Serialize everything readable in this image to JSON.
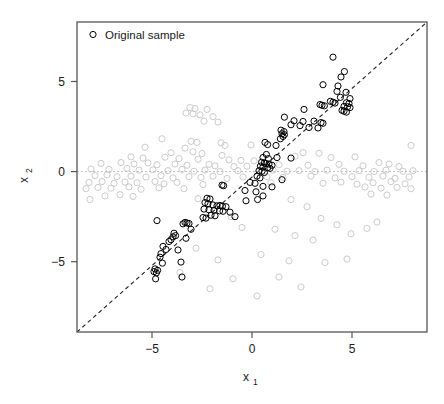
{
  "chart_data": {
    "type": "scatter",
    "title": "",
    "xlabel": "x_1",
    "xlabel_base": "x",
    "xlabel_sub": "1",
    "ylabel": "x_2",
    "ylabel_base": "x",
    "ylabel_sub": "2",
    "xlim": [
      -8.75,
      8.75
    ],
    "ylim": [
      -8.9,
      8.3
    ],
    "xticks": [
      -5,
      0,
      5
    ],
    "xticklabels": [
      "−5",
      "0",
      "5"
    ],
    "yticks": [
      -5,
      0,
      5
    ],
    "yticklabels": [
      "−5",
      "0",
      "5"
    ],
    "grid": false,
    "frame": true,
    "legend": {
      "position": "top-left",
      "entries": [
        {
          "label": "Original sample",
          "marker": "open-circle",
          "color": "#000000"
        }
      ]
    },
    "annotations": [
      {
        "name": "identity-line",
        "type": "line",
        "style": "dashed",
        "color": "#000000",
        "from": [
          -8.75,
          -8.9
        ],
        "to": [
          8.75,
          8.3
        ]
      },
      {
        "name": "zero-line",
        "type": "hline",
        "style": "dashed",
        "color": "#c0c0c0",
        "y": 0
      }
    ],
    "series": [
      {
        "name": "Original sample",
        "marker": "open-circle",
        "color": "#000000",
        "radius": 3.1,
        "linewidth": 1.0,
        "points": [
          [
            4.05,
            6.35
          ],
          [
            4.62,
            5.55
          ],
          [
            4.45,
            5.25
          ],
          [
            3.55,
            4.82
          ],
          [
            4.3,
            4.75
          ],
          [
            4.25,
            4.45
          ],
          [
            4.7,
            4.4
          ],
          [
            4.42,
            4.12
          ],
          [
            4.9,
            4.05
          ],
          [
            3.92,
            3.9
          ],
          [
            4.05,
            3.85
          ],
          [
            4.15,
            3.8
          ],
          [
            4.72,
            3.82
          ],
          [
            4.85,
            3.78
          ],
          [
            3.4,
            3.72
          ],
          [
            3.5,
            3.68
          ],
          [
            3.62,
            3.65
          ],
          [
            4.6,
            3.62
          ],
          [
            4.78,
            3.6
          ],
          [
            4.9,
            3.55
          ],
          [
            2.6,
            3.45
          ],
          [
            4.5,
            3.4
          ],
          [
            4.6,
            3.35
          ],
          [
            4.72,
            3.3
          ],
          [
            1.62,
            3.02
          ],
          [
            2.1,
            2.82
          ],
          [
            2.55,
            2.78
          ],
          [
            3.1,
            2.8
          ],
          [
            3.45,
            2.72
          ],
          [
            3.55,
            2.68
          ],
          [
            1.95,
            2.6
          ],
          [
            2.4,
            2.55
          ],
          [
            2.85,
            2.45
          ],
          [
            3.3,
            2.42
          ],
          [
            1.45,
            2.3
          ],
          [
            1.6,
            2.22
          ],
          [
            1.5,
            2.1
          ],
          [
            1.62,
            2.05
          ],
          [
            1.55,
            1.95
          ],
          [
            1.42,
            1.82
          ],
          [
            0.65,
            1.62
          ],
          [
            0.78,
            1.5
          ],
          [
            1.2,
            1.45
          ],
          [
            0.72,
            0.95
          ],
          [
            0.55,
            0.78
          ],
          [
            0.82,
            0.72
          ],
          [
            1.25,
            0.78
          ],
          [
            1.95,
            0.75
          ],
          [
            0.48,
            0.52
          ],
          [
            0.62,
            0.48
          ],
          [
            0.7,
            0.45
          ],
          [
            0.85,
            0.42
          ],
          [
            1.0,
            0.35
          ],
          [
            0.42,
            0.3
          ],
          [
            0.55,
            0.25
          ],
          [
            0.78,
            0.22
          ],
          [
            0.9,
            0.18
          ],
          [
            0.35,
            0.05
          ],
          [
            0.5,
            0.02
          ],
          [
            0.62,
            -0.05
          ],
          [
            0.25,
            -0.25
          ],
          [
            0.4,
            -0.35
          ],
          [
            1.5,
            -0.45
          ],
          [
            -0.1,
            -0.6
          ],
          [
            0.15,
            -0.65
          ],
          [
            -1.5,
            -0.75
          ],
          [
            -1.42,
            -0.78
          ],
          [
            0.55,
            -0.82
          ],
          [
            1.0,
            -0.85
          ],
          [
            -0.35,
            -1.05
          ],
          [
            0.2,
            -1.12
          ],
          [
            0.55,
            -1.35
          ],
          [
            -2.25,
            -1.48
          ],
          [
            -2.1,
            -1.52
          ],
          [
            0.28,
            -1.55
          ],
          [
            -0.3,
            -1.62
          ],
          [
            -2.35,
            -1.72
          ],
          [
            -2.2,
            -1.78
          ],
          [
            -1.95,
            -1.85
          ],
          [
            -1.75,
            -1.9
          ],
          [
            -1.6,
            -1.88
          ],
          [
            -1.48,
            -1.92
          ],
          [
            -1.3,
            -1.95
          ],
          [
            -2.4,
            -2.08
          ],
          [
            -2.15,
            -2.12
          ],
          [
            -1.9,
            -2.15
          ],
          [
            -1.62,
            -2.18
          ],
          [
            -1.45,
            -2.2
          ],
          [
            -1.1,
            -2.25
          ],
          [
            -2.05,
            -2.42
          ],
          [
            -1.85,
            -2.45
          ],
          [
            -2.45,
            -2.55
          ],
          [
            -2.3,
            -2.58
          ],
          [
            -0.85,
            -2.5
          ],
          [
            -3.35,
            -2.82
          ],
          [
            -3.25,
            -2.85
          ],
          [
            -3.15,
            -2.88
          ],
          [
            -3.45,
            -2.9
          ],
          [
            -4.75,
            -2.72
          ],
          [
            -3.05,
            -3.2
          ],
          [
            -3.9,
            -3.42
          ],
          [
            -3.82,
            -3.55
          ],
          [
            -3.95,
            -3.62
          ],
          [
            -3.3,
            -3.7
          ],
          [
            -4.05,
            -3.78
          ],
          [
            -4.15,
            -3.88
          ],
          [
            -4.45,
            -4.15
          ],
          [
            -4.3,
            -4.32
          ],
          [
            -3.7,
            -4.35
          ],
          [
            -4.55,
            -4.55
          ],
          [
            -4.6,
            -4.75
          ],
          [
            -3.55,
            -5.02
          ],
          [
            -4.48,
            -5.08
          ],
          [
            -4.85,
            -5.4
          ],
          [
            -4.72,
            -5.48
          ],
          [
            -4.9,
            -5.55
          ],
          [
            -4.78,
            -5.62
          ],
          [
            -3.5,
            -5.85
          ],
          [
            -4.82,
            -5.95
          ]
        ]
      },
      {
        "name": "Background sample",
        "marker": "open-circle",
        "color": "#cccccc",
        "radius": 3.1,
        "linewidth": 1.0,
        "points": [
          [
            -3.1,
            3.55
          ],
          [
            -2.85,
            3.5
          ],
          [
            -2.25,
            3.45
          ],
          [
            -3.3,
            3.25
          ],
          [
            -2.95,
            3.2
          ],
          [
            -2.6,
            3.15
          ],
          [
            -1.95,
            3.05
          ],
          [
            -2.4,
            2.8
          ],
          [
            -1.7,
            2.75
          ],
          [
            -4.5,
            1.82
          ],
          [
            -3.05,
            1.68
          ],
          [
            -2.75,
            1.62
          ],
          [
            -1.55,
            1.6
          ],
          [
            -5.35,
            1.35
          ],
          [
            -3.35,
            1.3
          ],
          [
            -1.35,
            1.45
          ],
          [
            -0.05,
            1.48
          ],
          [
            -4.05,
            1.05
          ],
          [
            -2.95,
            1.1
          ],
          [
            -2.5,
            1.0
          ],
          [
            -1.5,
            0.9
          ],
          [
            2.55,
            1.05
          ],
          [
            3.35,
            1.02
          ],
          [
            7.95,
            1.45
          ],
          [
            -6.05,
            0.82
          ],
          [
            -5.45,
            0.75
          ],
          [
            -4.35,
            0.8
          ],
          [
            -3.65,
            0.72
          ],
          [
            -2.7,
            0.68
          ],
          [
            -1.15,
            0.65
          ],
          [
            -0.55,
            0.62
          ],
          [
            0.1,
            0.6
          ],
          [
            2.15,
            0.85
          ],
          [
            3.95,
            0.78
          ],
          [
            5.15,
            0.82
          ],
          [
            -7.55,
            0.45
          ],
          [
            -6.55,
            0.5
          ],
          [
            -5.9,
            0.42
          ],
          [
            -5.2,
            0.48
          ],
          [
            -4.75,
            0.38
          ],
          [
            -3.85,
            0.42
          ],
          [
            -3.25,
            0.35
          ],
          [
            -2.15,
            0.4
          ],
          [
            -1.85,
            0.32
          ],
          [
            -0.9,
            0.28
          ],
          [
            -0.25,
            0.3
          ],
          [
            1.35,
            0.38
          ],
          [
            2.8,
            0.35
          ],
          [
            4.35,
            0.4
          ],
          [
            5.55,
            0.32
          ],
          [
            6.35,
            0.5
          ],
          [
            6.85,
            0.42
          ],
          [
            7.35,
            0.28
          ],
          [
            -8.05,
            0.15
          ],
          [
            -7.15,
            0.12
          ],
          [
            -6.25,
            0.18
          ],
          [
            -5.65,
            0.08
          ],
          [
            -4.95,
            0.1
          ],
          [
            -4.2,
            0.05
          ],
          [
            -3.5,
            0.12
          ],
          [
            -2.9,
            0.02
          ],
          [
            -2.35,
            0.08
          ],
          [
            -1.6,
            0.0
          ],
          [
            -0.7,
            0.05
          ],
          [
            0.35,
            0.0
          ],
          [
            1.05,
            0.08
          ],
          [
            1.75,
            0.02
          ],
          [
            2.35,
            0.05
          ],
          [
            3.15,
            0.0
          ],
          [
            3.75,
            0.08
          ],
          [
            4.6,
            0.02
          ],
          [
            5.35,
            0.05
          ],
          [
            6.1,
            0.0
          ],
          [
            6.7,
            0.08
          ],
          [
            7.55,
            0.02
          ],
          [
            8.05,
            0.05
          ],
          [
            -7.85,
            -0.22
          ],
          [
            -7.25,
            -0.18
          ],
          [
            -6.75,
            -0.28
          ],
          [
            -6.05,
            -0.25
          ],
          [
            -5.3,
            -0.3
          ],
          [
            -4.55,
            -0.22
          ],
          [
            -3.95,
            -0.35
          ],
          [
            -3.15,
            -0.28
          ],
          [
            -2.55,
            -0.32
          ],
          [
            -1.95,
            -0.25
          ],
          [
            -1.25,
            -0.38
          ],
          [
            -0.45,
            -0.3
          ],
          [
            0.75,
            -0.28
          ],
          [
            1.55,
            -0.32
          ],
          [
            2.95,
            -0.25
          ],
          [
            4.15,
            -0.35
          ],
          [
            5.0,
            -0.28
          ],
          [
            5.85,
            -0.32
          ],
          [
            6.55,
            -0.25
          ],
          [
            7.15,
            -0.38
          ],
          [
            7.85,
            -0.3
          ],
          [
            -8.15,
            -0.6
          ],
          [
            -7.5,
            -0.55
          ],
          [
            -6.9,
            -0.65
          ],
          [
            -6.35,
            -0.58
          ],
          [
            -5.75,
            -0.62
          ],
          [
            -4.85,
            -0.55
          ],
          [
            -4.4,
            -0.68
          ],
          [
            -3.75,
            -0.6
          ],
          [
            -2.45,
            -0.72
          ],
          [
            0.95,
            -0.62
          ],
          [
            3.55,
            -0.65
          ],
          [
            4.45,
            -0.58
          ],
          [
            5.25,
            -0.7
          ],
          [
            6.05,
            -0.62
          ],
          [
            6.95,
            -0.55
          ],
          [
            7.65,
            -0.68
          ],
          [
            -8.3,
            -0.95
          ],
          [
            -7.7,
            -0.88
          ],
          [
            -7.05,
            -0.92
          ],
          [
            -6.15,
            -0.85
          ],
          [
            -5.55,
            -0.98
          ],
          [
            -4.65,
            -0.9
          ],
          [
            -3.4,
            -0.95
          ],
          [
            5.65,
            -0.85
          ],
          [
            6.45,
            -0.92
          ],
          [
            7.25,
            -0.88
          ],
          [
            7.95,
            -0.95
          ],
          [
            -7.35,
            -1.35
          ],
          [
            -6.6,
            -1.28
          ],
          [
            -5.95,
            -1.38
          ],
          [
            -8.1,
            -1.55
          ],
          [
            5.95,
            -1.25
          ],
          [
            6.75,
            -1.3
          ],
          [
            -2.7,
            -1.5
          ],
          [
            1.95,
            -1.55
          ],
          [
            2.75,
            -1.95
          ],
          [
            3.45,
            -2.6
          ],
          [
            4.25,
            -2.95
          ],
          [
            -1.05,
            -2.5
          ],
          [
            -0.5,
            -3.1
          ],
          [
            1.15,
            -3.2
          ],
          [
            2.15,
            -3.55
          ],
          [
            3.05,
            -3.8
          ],
          [
            -2.8,
            -4.25
          ],
          [
            -1.7,
            -4.9
          ],
          [
            0.45,
            -4.6
          ],
          [
            1.85,
            -4.95
          ],
          [
            4.95,
            -3.45
          ],
          [
            5.75,
            -3.15
          ],
          [
            -3.6,
            -5.6
          ],
          [
            -0.95,
            -5.95
          ],
          [
            1.35,
            -5.85
          ],
          [
            3.65,
            -5.05
          ],
          [
            6.25,
            -2.8
          ],
          [
            -2.1,
            -6.5
          ],
          [
            0.25,
            -6.9
          ],
          [
            2.45,
            -6.4
          ],
          [
            4.75,
            -4.85
          ]
        ]
      }
    ]
  },
  "plot_geometry": {
    "frame_left": 77,
    "frame_top": 22,
    "frame_right": 427,
    "frame_bottom": 332,
    "frame_color": "#555555"
  },
  "legend": {
    "marker_label": "Original sample"
  }
}
